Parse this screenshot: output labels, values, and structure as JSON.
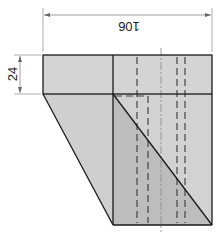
{
  "diagram": {
    "type": "technical-drawing",
    "dimensions": {
      "width_label": "106",
      "height_label": "24"
    },
    "colors": {
      "fill_light": "#d6d6d6",
      "fill_mid": "#c4c4c4",
      "fill_dark": "#b0b0b0",
      "line": "#1a1a1a",
      "dashed": "#444444",
      "dim_line": "#888888"
    }
  }
}
